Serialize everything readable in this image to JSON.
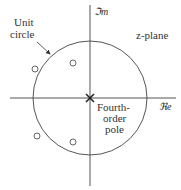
{
  "diagram": {
    "labels": {
      "unit_circle_line1": "Unit",
      "unit_circle_line2": "circle",
      "imag_axis": "ℑm",
      "real_axis": "ℜe",
      "plane": "z-plane",
      "pole_line1": "Fourth-",
      "pole_line2": "order",
      "pole_line3": "pole"
    },
    "geometry": {
      "center": [
        90,
        98
      ],
      "radius": 57
    },
    "zeros": [
      {
        "x": 35,
        "y": 69
      },
      {
        "x": 73,
        "y": 63
      },
      {
        "x": 37,
        "y": 136
      },
      {
        "x": 73,
        "y": 142
      }
    ],
    "pole": {
      "x": 90,
      "y": 98,
      "order": 4
    },
    "colors": {
      "line": "#555555",
      "text": "#333333"
    }
  }
}
